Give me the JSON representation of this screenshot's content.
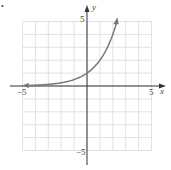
{
  "bullet": "•",
  "chart_data": {
    "type": "line",
    "title": "",
    "function": "y = 2^x",
    "xlabel": "x",
    "ylabel": "y",
    "xlim": [
      -5,
      5
    ],
    "ylim": [
      -5,
      5
    ],
    "grid": true,
    "tick_labels": {
      "x": [
        "-5",
        "5"
      ],
      "y": [
        "5",
        "-5"
      ]
    },
    "series": [
      {
        "name": "y=2^x",
        "x": [
          -4.8,
          -4,
          -3,
          -2,
          -1,
          0,
          1,
          2,
          2.3
        ],
        "y": [
          0.04,
          0.06,
          0.125,
          0.25,
          0.5,
          1,
          2,
          4,
          4.9
        ]
      }
    ],
    "curve_color": "#777777"
  },
  "labels": {
    "x_axis": "x",
    "y_axis": "y",
    "x_min": "−5",
    "x_max": "5",
    "y_max": "5",
    "y_min": "−5"
  }
}
